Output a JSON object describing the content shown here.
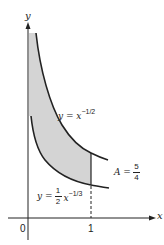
{
  "figure": {
    "axes": {
      "x_label": "x",
      "y_label": "y",
      "origin_label": "0",
      "x_tick_label": "1"
    },
    "curves": [
      {
        "name": "upper",
        "label_lhs": "y = x",
        "label_exp": "−1/2"
      },
      {
        "name": "lower",
        "label_lhs": "y =",
        "coef_num": "1",
        "coef_den": "2",
        "label_var": "x",
        "label_exp": "−1/3"
      }
    ],
    "area": {
      "label": "A =",
      "num": "5",
      "den": "4"
    },
    "colors": {
      "shade": "#d4d4d4",
      "stroke": "#222222"
    }
  }
}
